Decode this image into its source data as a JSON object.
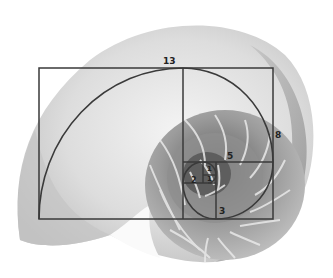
{
  "figure": {
    "labels": {
      "l13": "13",
      "l8": "8",
      "l5": "5",
      "l3": "3",
      "l2": "2",
      "l1a": "1",
      "l1b": "1"
    },
    "colors": {
      "background": "#ffffff",
      "shell_light": "#e6e6e6",
      "shell_mid": "#b5b5b5",
      "shell_dark": "#6f6f6f",
      "lines": "#3a3a3a",
      "label": "#222222"
    }
  }
}
